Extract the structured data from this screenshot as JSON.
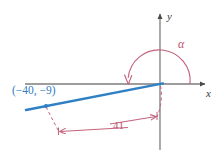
{
  "figure": {
    "background_color": "#ffffff",
    "axis_color": "#7d7d7d",
    "ray_color": "#2f80c4",
    "accent_color": "#c4637c",
    "label_color_blue": "#2f80c4",
    "label_color_pink": "#b9556f"
  },
  "axes": {
    "x_label": "x",
    "y_label": "y",
    "origin_x": 160,
    "origin_y": 84
  },
  "angle": {
    "symbol": "α",
    "arc_start_deg": 0,
    "arc_end_deg": 190,
    "direction": "counterclockwise"
  },
  "point": {
    "label": "(−40, −9)",
    "x": -40,
    "y": -9,
    "px": 46,
    "py": 106
  },
  "measurement": {
    "label": "41",
    "value": 41,
    "description": "length of terminal ray segment"
  }
}
